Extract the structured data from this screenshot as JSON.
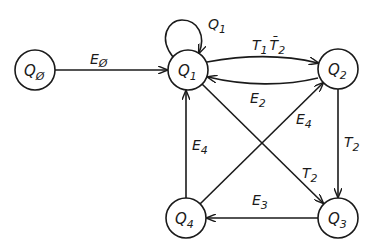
{
  "diagram": {
    "type": "state-transition",
    "stroke_color": "#1a1a1a",
    "background": "#ffffff",
    "nodes": [
      {
        "id": "Q0",
        "main": "Q",
        "sub": "Ø",
        "cx": 35,
        "cy": 70,
        "r": 20
      },
      {
        "id": "Q1",
        "main": "Q",
        "sub": "1",
        "cx": 188,
        "cy": 70,
        "r": 20
      },
      {
        "id": "Q2",
        "main": "Q",
        "sub": "2",
        "cx": 338,
        "cy": 69,
        "r": 20
      },
      {
        "id": "Q3",
        "main": "Q",
        "sub": "3",
        "cx": 338,
        "cy": 218,
        "r": 20
      },
      {
        "id": "Q4",
        "main": "Q",
        "sub": "4",
        "cx": 186,
        "cy": 218,
        "r": 20
      }
    ],
    "edges": [
      {
        "from": "Q0",
        "to": "Q1",
        "label_main": "E",
        "label_sub": "Ø"
      },
      {
        "from": "Q1",
        "to": "Q1",
        "label_main": "Q",
        "label_sub": "1"
      },
      {
        "from": "Q1",
        "to": "Q2",
        "label_main": "T",
        "label_sub": "1",
        "label_main2": "T̄",
        "label_sub2": "2"
      },
      {
        "from": "Q2",
        "to": "Q1",
        "label_main": "E",
        "label_sub": "2"
      },
      {
        "from": "Q4",
        "to": "Q2",
        "label_main": "E",
        "label_sub": "4"
      },
      {
        "from": "Q2",
        "to": "Q3",
        "label_main": "T",
        "label_sub": "2"
      },
      {
        "from": "Q1",
        "to": "Q3",
        "label_main": "T",
        "label_sub": "2"
      },
      {
        "from": "Q3",
        "to": "Q4",
        "label_main": "E",
        "label_sub": "3"
      },
      {
        "from": "Q4",
        "to": "Q1",
        "label_main": "E",
        "label_sub": "4"
      }
    ]
  }
}
